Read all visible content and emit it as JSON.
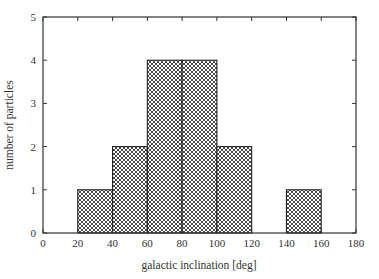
{
  "chart_data": {
    "type": "bar",
    "subtype": "histogram",
    "title": "",
    "xlabel": "galactic inclination [deg]",
    "ylabel": "number of particles",
    "xlim": [
      0,
      180
    ],
    "ylim": [
      0,
      5
    ],
    "xticks": [
      0,
      20,
      40,
      60,
      80,
      100,
      120,
      140,
      160,
      180
    ],
    "yticks": [
      0,
      1,
      2,
      3,
      4,
      5
    ],
    "grid": false,
    "legend": null,
    "fill": "crosshatch",
    "bins": [
      {
        "x0": 20,
        "x1": 40,
        "count": 1
      },
      {
        "x0": 40,
        "x1": 60,
        "count": 2
      },
      {
        "x0": 60,
        "x1": 80,
        "count": 4
      },
      {
        "x0": 80,
        "x1": 100,
        "count": 4
      },
      {
        "x0": 100,
        "x1": 120,
        "count": 2
      },
      {
        "x0": 140,
        "x1": 160,
        "count": 1
      }
    ],
    "categories": [
      "20-40",
      "40-60",
      "60-80",
      "80-100",
      "100-120",
      "140-160"
    ],
    "values": [
      1,
      2,
      4,
      4,
      2,
      1
    ]
  },
  "colors": {
    "axis": "#333333",
    "bar_edge": "#222222",
    "hatch": "#333333",
    "background": "#ffffff"
  }
}
